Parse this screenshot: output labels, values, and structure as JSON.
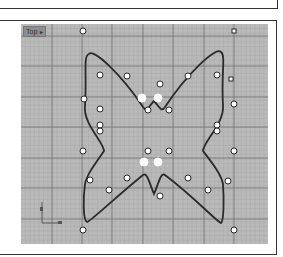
{
  "viewport": {
    "label": "Top",
    "dropdown_icon": "▸",
    "background": "#b9b9b9",
    "grid_minor_color": "#a9a9a9",
    "grid_major_color": "#707070"
  },
  "curve": {
    "name": "butterfly-curve",
    "stroke": "#2a2a2a",
    "closed": true
  },
  "control_points": {
    "count": 30,
    "selected_count": 4
  },
  "axis_indicator": {
    "x_label": "x",
    "y_label": "y"
  }
}
